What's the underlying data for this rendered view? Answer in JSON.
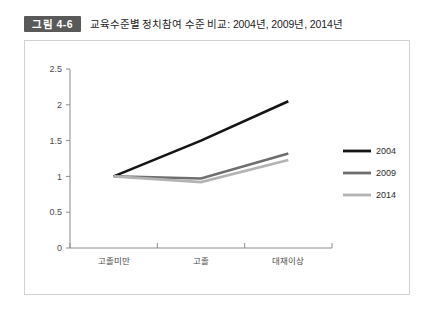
{
  "figure": {
    "badge": "그림 4-6",
    "title": "교육수준별 정치참여 수준 비교: 2004년, 2009년, 2014년"
  },
  "chart_data": {
    "type": "line",
    "title": "교육수준별 정치참여 수준 비교: 2004년, 2009년, 2014년",
    "xlabel": "",
    "ylabel": "",
    "categories": [
      "고졸미만",
      "고졸",
      "대재이상"
    ],
    "series": [
      {
        "name": "2004",
        "values": [
          1.0,
          1.5,
          2.05
        ],
        "color": "#141414"
      },
      {
        "name": "2009",
        "values": [
          1.0,
          0.97,
          1.32
        ],
        "color": "#6e6e6e"
      },
      {
        "name": "2014",
        "values": [
          1.0,
          0.92,
          1.23
        ],
        "color": "#b3b3b3"
      }
    ],
    "ylim": [
      0,
      2.5
    ],
    "yticks": [
      "0",
      "0.5",
      "1",
      "1.5",
      "2",
      "2.5"
    ],
    "ytick_values": [
      0,
      0.5,
      1,
      1.5,
      2,
      2.5
    ],
    "grid": false,
    "legend_position": "right"
  },
  "legend": {
    "entries": [
      {
        "label": "2004",
        "color": "#141414"
      },
      {
        "label": "2009",
        "color": "#6e6e6e"
      },
      {
        "label": "2014",
        "color": "#b3b3b3"
      }
    ]
  },
  "axis": {
    "line_color": "#8c8c8c"
  }
}
